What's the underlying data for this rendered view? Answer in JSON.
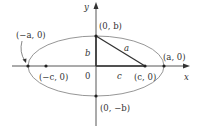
{
  "diagram": {
    "axes": {
      "x_label": "x",
      "y_label": "y",
      "origin_label": "0"
    },
    "points": {
      "vertex_left": "(−a, 0)",
      "vertex_right": "(a, 0)",
      "covertex_top": "(0, b)",
      "covertex_bottom": "(0, −b)",
      "focus_left": "(−c, 0)",
      "focus_right": "(c, 0)"
    },
    "segment_labels": {
      "hyp": "a",
      "vertical": "b",
      "horizontal": "c"
    },
    "colors": {
      "ellipse": "#8a8a8a",
      "axes": "#444444",
      "triangle": "#333333",
      "points": "#222222"
    }
  }
}
